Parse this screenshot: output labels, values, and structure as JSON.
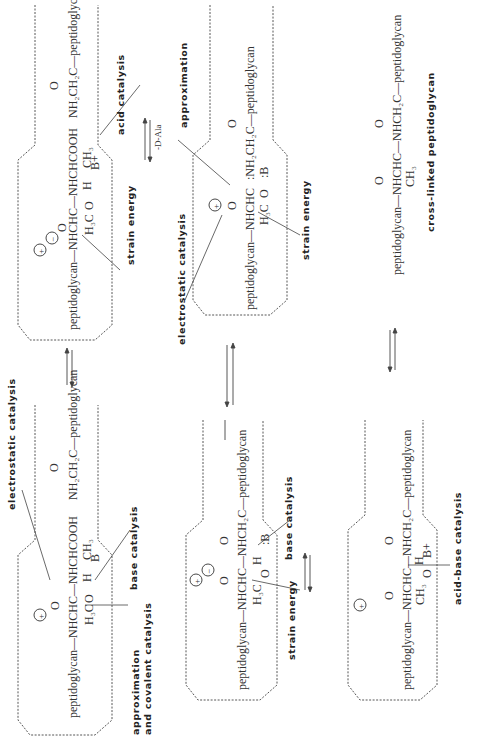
{
  "diagram": {
    "orientation": "rotated 90 degrees (text reads bottom-to-top)",
    "panels": [
      {
        "id": "panel-1",
        "position": "bottom-left",
        "structures": [
          "peptidoglycan—NHCHC—NHCHCOOH",
          "O",
          "H₃C",
          "H",
          "CH₃",
          "O",
          "B",
          "NH₂CH₂C—peptidoglycan",
          "O"
        ],
        "charges": [
          "+"
        ],
        "labels": [
          "electrostatic catalysis",
          "base catalysis",
          "approximation",
          "and covalent catalysis"
        ]
      },
      {
        "id": "panel-2",
        "position": "top-left",
        "structures": [
          "peptidoglycan—NHCHC—NHCHCOOH",
          "O",
          "H₃C",
          "H",
          "CH₃",
          "O",
          "B+",
          "NH₂CH₂C—peptidoglycan",
          "O"
        ],
        "charges": [
          "+",
          "−"
        ],
        "labels": [
          "acid catalysis",
          "strain energy"
        ]
      },
      {
        "id": "panel-3",
        "position": "top-middle",
        "structures": [
          "peptidoglycan—NHCHC",
          "O",
          "H₃C",
          "O",
          ":B",
          ":NH₂CH₂C—peptidoglycan",
          "O"
        ],
        "charges": [
          "+"
        ],
        "labels": [
          "approximation",
          "electrostatic catalysis",
          "strain energy"
        ],
        "step_label": "-D-Ala"
      },
      {
        "id": "panel-4",
        "position": "bottom-middle",
        "structures": [
          "peptidoglycan—NHCHC—NHCH₂C—peptidoglycan",
          "O",
          "H₃C",
          "H",
          "O",
          ":B",
          "O"
        ],
        "charges": [
          "+",
          "−",
          "+"
        ],
        "labels": [
          "base catalysis",
          "strain energy"
        ]
      },
      {
        "id": "panel-5",
        "position": "bottom-right",
        "structures": [
          "peptidoglycan—NHCHC—NHCH₂C—peptidoglycan",
          "O",
          "CH₃",
          "O",
          "H",
          "B+",
          "O"
        ],
        "charges": [
          "+"
        ],
        "labels": [
          "acid-base catalysis"
        ]
      },
      {
        "id": "product",
        "position": "top-right",
        "structures": [
          "peptidoglycan—NHCHC—NHCH₂C—peptidoglycan",
          "O",
          "CH₃",
          "O"
        ],
        "labels": [
          "cross-linked peptidoglycan"
        ]
      }
    ],
    "text": {
      "p1_main": "peptidoglycan—NHCHC—NHCHCOOH",
      "p1_sub": "NH₂CH₂C—peptidoglycan",
      "p1_h3c": "H₃C",
      "p1_ch3": "CH₃",
      "p1_h": "H",
      "p1_o1": "O",
      "p1_o2": "O",
      "p1_o3": "O",
      "p1_b": "B",
      "p1_l_elec": "electrostatic   catalysis",
      "p1_l_base": "base   catalysis",
      "p1_l_approx1": "approximation",
      "p1_l_approx2": "and  covalent  catalysis",
      "p2_main": "peptidoglycan—NHCHC—NHCHCOOH",
      "p2_sub": "NH₂CH₂C—peptidoglycan",
      "p2_h3c": "H₃C",
      "p2_ch3": "CH₃",
      "p2_h": "H",
      "p2_o1": "O",
      "p2_o2": "O",
      "p2_o3": "O",
      "p2_b": "B+",
      "p2_l_acid": "acid   catalysis",
      "p2_l_strain": "strain   energy",
      "p3_main": "peptidoglycan—NHCHC",
      "p3_sub": ":NH₂CH₂C—peptidoglycan",
      "p3_h3c": "H₃C",
      "p3_o1": "O",
      "p3_o2": "O",
      "p3_o3": "O",
      "p3_b": ":B",
      "p3_l_approx": "approximation",
      "p3_l_elec": "electrostatic   catalysis",
      "p3_l_strain": "strain   energy",
      "p3_step": "-D-Ala",
      "p4_main": "peptidoglycan—NHCHC—NHCH₂C—peptidoglycan",
      "p4_h3c": "H₃C",
      "p4_h": "H",
      "p4_o1": "O",
      "p4_o2": "O",
      "p4_o3": "O",
      "p4_b": ":B",
      "p4_l_base": "base   catalysis",
      "p4_l_strain": "strain   energy",
      "p5_main": "peptidoglycan—NHCHC—NHCH₂C—peptidoglycan",
      "p5_ch3": "CH₃",
      "p5_h": "H",
      "p5_o1": "O",
      "p5_o2": "O",
      "p5_o3": "O",
      "p5_b": "B+",
      "p5_l_acidbase": "acid-base   catalysis",
      "p6_main": "peptidoglycan—NHCHC—NHCH₂C—peptidoglycan",
      "p6_ch3": "CH₃",
      "p6_o1": "O",
      "p6_o2": "O",
      "p6_l_cross": "cross-linked   peptidoglycan",
      "plus": "+",
      "minus": "−"
    },
    "arrows": [
      {
        "from": "panel-1",
        "to": "panel-2",
        "type": "equilibrium"
      },
      {
        "from": "panel-2",
        "to": "panel-3",
        "type": "equilibrium",
        "label": "-D-Ala"
      },
      {
        "from": "panel-3",
        "to": "panel-4",
        "type": "equilibrium"
      },
      {
        "from": "panel-4",
        "to": "panel-5",
        "type": "equilibrium"
      },
      {
        "from": "panel-5",
        "to": "product",
        "type": "equilibrium"
      }
    ],
    "colors": {
      "ink": "#333333",
      "background": "#ffffff"
    }
  }
}
